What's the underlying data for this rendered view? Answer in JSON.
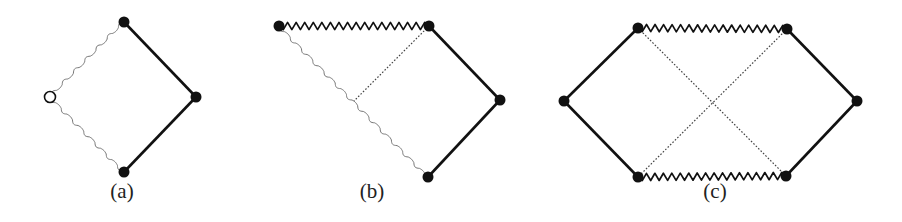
{
  "figure": {
    "colors": {
      "ink": "#111111",
      "thin_wavy": "#777777",
      "dotted": "#444444",
      "open_fill": "#ffffff"
    },
    "panels": [
      {
        "id": "a",
        "label": "(a)",
        "label_pos": [
          122,
          198
        ],
        "nodes": [
          {
            "name": "top",
            "x": 124,
            "y": 22,
            "filled": true
          },
          {
            "name": "left",
            "x": 50,
            "y": 97,
            "filled": false
          },
          {
            "name": "right",
            "x": 196,
            "y": 97,
            "filled": true
          },
          {
            "name": "bottom",
            "x": 124,
            "y": 172,
            "filled": true
          }
        ],
        "edges": [
          {
            "from": [
              124,
              22
            ],
            "to": [
              196,
              97
            ],
            "style": "solid"
          },
          {
            "from": [
              196,
              97
            ],
            "to": [
              124,
              172
            ],
            "style": "solid"
          },
          {
            "from": [
              124,
              22
            ],
            "to": [
              50,
              97
            ],
            "style": "wavy"
          },
          {
            "from": [
              50,
              97
            ],
            "to": [
              124,
              172
            ],
            "style": "wavy"
          }
        ]
      },
      {
        "id": "b",
        "label": "(b)",
        "label_pos": [
          372,
          198
        ],
        "nodes": [
          {
            "name": "top-left",
            "x": 279,
            "y": 26,
            "filled": true
          },
          {
            "name": "top-right",
            "x": 429,
            "y": 26,
            "filled": true
          },
          {
            "name": "right",
            "x": 500,
            "y": 100,
            "filled": true
          },
          {
            "name": "bottom",
            "x": 428,
            "y": 177,
            "filled": true
          }
        ],
        "edges": [
          {
            "from": [
              279,
              26
            ],
            "to": [
              429,
              26
            ],
            "style": "zigzag"
          },
          {
            "from": [
              429,
              26
            ],
            "to": [
              500,
              100
            ],
            "style": "solid"
          },
          {
            "from": [
              500,
              100
            ],
            "to": [
              428,
              177
            ],
            "style": "solid"
          },
          {
            "from": [
              279,
              26
            ],
            "to": [
              428,
              177
            ],
            "style": "wavy"
          },
          {
            "from": [
              429,
              26
            ],
            "to": [
              354,
              101
            ],
            "style": "dotted"
          }
        ]
      },
      {
        "id": "c",
        "label": "(c)",
        "label_pos": [
          715,
          198
        ],
        "nodes": [
          {
            "name": "left",
            "x": 564,
            "y": 101,
            "filled": true
          },
          {
            "name": "top-left",
            "x": 638,
            "y": 28,
            "filled": true
          },
          {
            "name": "top-right",
            "x": 787,
            "y": 29,
            "filled": true
          },
          {
            "name": "right",
            "x": 857,
            "y": 101,
            "filled": true
          },
          {
            "name": "bottom-left",
            "x": 638,
            "y": 177,
            "filled": true
          },
          {
            "name": "bottom-right",
            "x": 786,
            "y": 176,
            "filled": true
          }
        ],
        "edges": [
          {
            "from": [
              564,
              101
            ],
            "to": [
              638,
              28
            ],
            "style": "solid"
          },
          {
            "from": [
              564,
              101
            ],
            "to": [
              638,
              177
            ],
            "style": "solid"
          },
          {
            "from": [
              787,
              29
            ],
            "to": [
              857,
              101
            ],
            "style": "solid"
          },
          {
            "from": [
              857,
              101
            ],
            "to": [
              786,
              176
            ],
            "style": "solid"
          },
          {
            "from": [
              638,
              28
            ],
            "to": [
              787,
              29
            ],
            "style": "zigzag"
          },
          {
            "from": [
              638,
              177
            ],
            "to": [
              786,
              176
            ],
            "style": "zigzag"
          },
          {
            "from": [
              638,
              28
            ],
            "to": [
              786,
              176
            ],
            "style": "dotted"
          },
          {
            "from": [
              787,
              29
            ],
            "to": [
              638,
              177
            ],
            "style": "dotted"
          }
        ]
      }
    ]
  }
}
